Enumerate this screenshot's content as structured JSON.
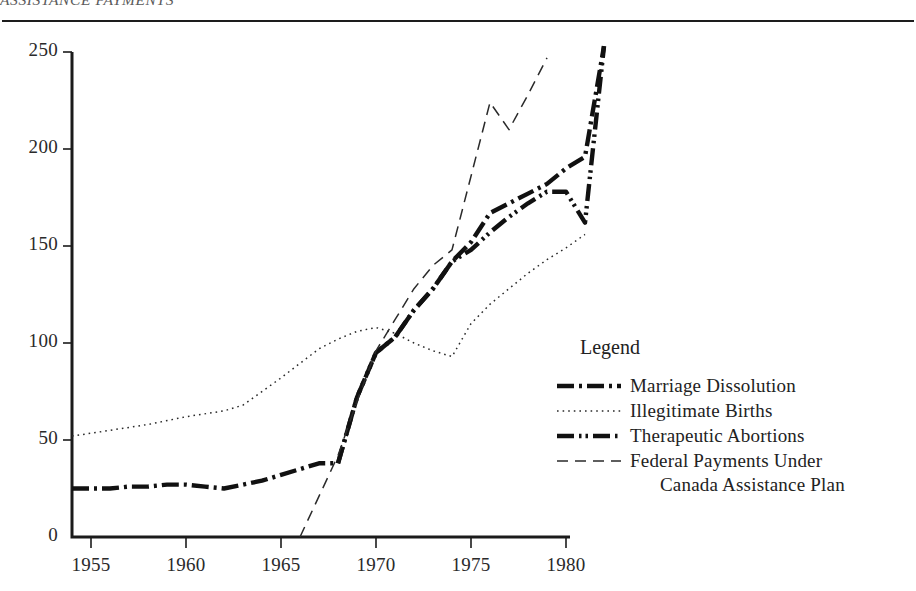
{
  "header": {
    "running_title": "ASSISTANCE PAYMENTS"
  },
  "legend": {
    "title": "Legend",
    "items": [
      {
        "label": "Marriage Dissolution",
        "style": "dash-dot",
        "icon": "line-dash-dot-swatch"
      },
      {
        "label": "Illegitimate Births",
        "style": "dotted",
        "icon": "line-dotted-swatch"
      },
      {
        "label": "Therapeutic Abortions",
        "style": "dash-dot-dot",
        "icon": "line-dash-dot-dot-swatch"
      },
      {
        "label": "Federal Payments Under",
        "style": "dashed",
        "icon": "line-dashed-swatch"
      }
    ],
    "continuation_line": "Canada Assistance Plan"
  },
  "axes": {
    "y_ticks": [
      "0",
      "50",
      "100",
      "150",
      "200",
      "250"
    ],
    "x_ticks": [
      "1955",
      "1960",
      "1965",
      "1970",
      "1975",
      "1980"
    ]
  },
  "chart_data": {
    "type": "line",
    "title": "",
    "xlabel": "",
    "ylabel": "",
    "xlim": [
      1954,
      1982
    ],
    "ylim": [
      0,
      255
    ],
    "grid": false,
    "legend_position": "right-middle",
    "x_ticks": [
      1955,
      1960,
      1965,
      1970,
      1975,
      1980
    ],
    "y_ticks": [
      0,
      50,
      100,
      150,
      200,
      250
    ],
    "series": [
      {
        "name": "Marriage Dissolution",
        "style": "dash-dot",
        "width": "thick",
        "color": "#111111",
        "points": [
          [
            1954,
            25
          ],
          [
            1955,
            25
          ],
          [
            1956,
            25
          ],
          [
            1957,
            26
          ],
          [
            1958,
            26
          ],
          [
            1959,
            27
          ],
          [
            1960,
            27
          ],
          [
            1961,
            26
          ],
          [
            1962,
            25
          ],
          [
            1963,
            27
          ],
          [
            1964,
            29
          ],
          [
            1965,
            32
          ],
          [
            1966,
            35
          ],
          [
            1967,
            38
          ],
          [
            1968,
            38
          ],
          [
            1969,
            72
          ],
          [
            1970,
            95
          ],
          [
            1971,
            103
          ],
          [
            1972,
            117
          ],
          [
            1973,
            128
          ],
          [
            1974,
            142
          ],
          [
            1975,
            152
          ],
          [
            1976,
            167
          ],
          [
            1977,
            172
          ],
          [
            1978,
            177
          ],
          [
            1979,
            182
          ],
          [
            1980,
            190
          ],
          [
            1981,
            196
          ],
          [
            1982,
            253
          ]
        ]
      },
      {
        "name": "Illegitimate Births",
        "style": "dotted",
        "width": "thin",
        "color": "#2a2a2a",
        "points": [
          [
            1954,
            52
          ],
          [
            1956,
            55
          ],
          [
            1958,
            58
          ],
          [
            1960,
            62
          ],
          [
            1962,
            65
          ],
          [
            1963,
            68
          ],
          [
            1965,
            82
          ],
          [
            1967,
            97
          ],
          [
            1968,
            102
          ],
          [
            1969,
            106
          ],
          [
            1970,
            108
          ],
          [
            1971,
            105
          ],
          [
            1972,
            100
          ],
          [
            1973,
            96
          ],
          [
            1974,
            93
          ],
          [
            1975,
            110
          ],
          [
            1976,
            120
          ],
          [
            1977,
            128
          ],
          [
            1978,
            136
          ],
          [
            1979,
            143
          ],
          [
            1980,
            149
          ],
          [
            1981,
            156
          ]
        ]
      },
      {
        "name": "Therapeutic Abortions",
        "style": "dash-dot-dot",
        "width": "thick",
        "color": "#111111",
        "points": [
          [
            1968,
            38
          ],
          [
            1969,
            72
          ],
          [
            1970,
            95
          ],
          [
            1971,
            103
          ],
          [
            1972,
            117
          ],
          [
            1973,
            128
          ],
          [
            1974,
            142
          ],
          [
            1975,
            148
          ],
          [
            1976,
            157
          ],
          [
            1977,
            165
          ],
          [
            1978,
            172
          ],
          [
            1979,
            178
          ],
          [
            1980,
            178
          ],
          [
            1981,
            162
          ],
          [
            1982,
            253
          ]
        ]
      },
      {
        "name": "Federal Payments Under Canada Assistance Plan",
        "style": "dashed",
        "width": "thin",
        "color": "#2a2a2a",
        "points": [
          [
            1966,
            0
          ],
          [
            1968,
            42
          ],
          [
            1969,
            70
          ],
          [
            1970,
            96
          ],
          [
            1971,
            112
          ],
          [
            1972,
            128
          ],
          [
            1973,
            140
          ],
          [
            1974,
            148
          ],
          [
            1975,
            186
          ],
          [
            1976,
            224
          ],
          [
            1977,
            210
          ],
          [
            1978,
            228
          ],
          [
            1979,
            247
          ]
        ]
      }
    ]
  }
}
